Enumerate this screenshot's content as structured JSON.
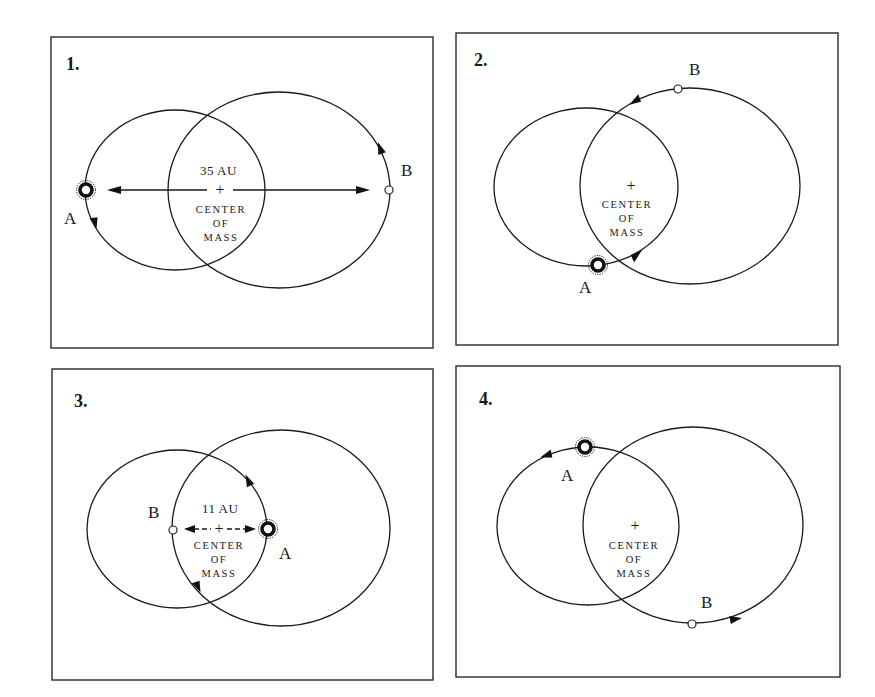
{
  "figure": {
    "panels": [
      {
        "number": "1.",
        "star_a_label": "A",
        "star_b_label": "B",
        "separation_label": "35 AU",
        "center_label_lines": [
          "CENTER",
          "OF",
          "MASS"
        ],
        "center_marker": "+"
      },
      {
        "number": "2.",
        "star_a_label": "A",
        "star_b_label": "B",
        "center_label_lines": [
          "CENTER",
          "OF",
          "MASS"
        ],
        "center_marker": "+"
      },
      {
        "number": "3.",
        "star_a_label": "A",
        "star_b_label": "B",
        "separation_label": "11 AU",
        "center_label_lines": [
          "CENTER",
          "OF",
          "MASS"
        ],
        "center_marker": "+"
      },
      {
        "number": "4.",
        "star_a_label": "A",
        "star_b_label": "B",
        "center_label_lines": [
          "CENTER",
          "OF",
          "MASS"
        ],
        "center_marker": "+"
      }
    ],
    "colors": {
      "line": "#1a1a1a",
      "background": "#ffffff",
      "frame": "#2a2a2a"
    }
  }
}
